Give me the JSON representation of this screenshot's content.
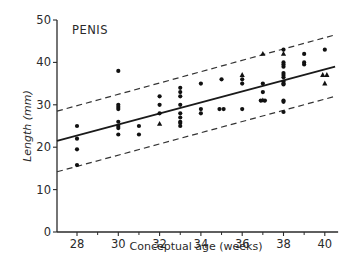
{
  "chart_data": {
    "type": "scatter",
    "title": "PENIS",
    "xlabel": "Conceptual age (weeks)",
    "ylabel": "Length (mm)",
    "xlim": [
      27,
      40.5
    ],
    "ylim": [
      0,
      50
    ],
    "x_ticks": [
      28,
      30,
      32,
      34,
      36,
      38,
      40
    ],
    "x_minor_ticks": [
      29,
      31,
      33,
      35,
      37,
      39
    ],
    "y_ticks": [
      0,
      10,
      20,
      30,
      40,
      50
    ],
    "grid": false,
    "legend": null,
    "series": [
      {
        "name": "circles",
        "marker": "circle",
        "points": [
          [
            28,
            25
          ],
          [
            28,
            22
          ],
          [
            28,
            19.5
          ],
          [
            28,
            15.8
          ],
          [
            30,
            38
          ],
          [
            30,
            30
          ],
          [
            30,
            29.5
          ],
          [
            30,
            29
          ],
          [
            30,
            26
          ],
          [
            30,
            25
          ],
          [
            30,
            24.5
          ],
          [
            30,
            23
          ],
          [
            31,
            25
          ],
          [
            31,
            23
          ],
          [
            32,
            32
          ],
          [
            32,
            30
          ],
          [
            32,
            28
          ],
          [
            33,
            34
          ],
          [
            33,
            33
          ],
          [
            33,
            32
          ],
          [
            33,
            30
          ],
          [
            33,
            28
          ],
          [
            33,
            27
          ],
          [
            33,
            26
          ],
          [
            33,
            25.7
          ],
          [
            33,
            25
          ],
          [
            34,
            35
          ],
          [
            34,
            29
          ],
          [
            34,
            28
          ],
          [
            35,
            36
          ],
          [
            34.9,
            29
          ],
          [
            35.1,
            29
          ],
          [
            36,
            36
          ],
          [
            36,
            35
          ],
          [
            36,
            29
          ],
          [
            37,
            35
          ],
          [
            37,
            33
          ],
          [
            36.9,
            31
          ],
          [
            37.1,
            31
          ],
          [
            38,
            43
          ],
          [
            38,
            40
          ],
          [
            38,
            39.5
          ],
          [
            38,
            39
          ],
          [
            38,
            37.5
          ],
          [
            38,
            37
          ],
          [
            38,
            36.5
          ],
          [
            38,
            35.5
          ],
          [
            38,
            35
          ],
          [
            38,
            34.8
          ],
          [
            38,
            31
          ],
          [
            38,
            30.7
          ],
          [
            38,
            28.3
          ],
          [
            39,
            42
          ],
          [
            39,
            40
          ],
          [
            39,
            39.5
          ],
          [
            40,
            43
          ]
        ]
      },
      {
        "name": "triangles",
        "marker": "triangle",
        "points": [
          [
            32,
            25.5
          ],
          [
            36,
            37
          ],
          [
            37,
            42
          ],
          [
            37,
            31
          ],
          [
            38,
            42
          ],
          [
            39.9,
            37
          ],
          [
            40.1,
            37
          ],
          [
            40,
            35
          ]
        ]
      }
    ],
    "regression_line": {
      "style": "solid",
      "from": [
        27,
        21.5
      ],
      "to": [
        40.5,
        39
      ]
    },
    "confidence_bounds": [
      {
        "name": "upper",
        "style": "dashed",
        "from": [
          27,
          28.5
        ],
        "to": [
          40.5,
          46.5
        ]
      },
      {
        "name": "lower",
        "style": "dashed",
        "from": [
          27,
          14.2
        ],
        "to": [
          40.5,
          32
        ]
      }
    ]
  }
}
